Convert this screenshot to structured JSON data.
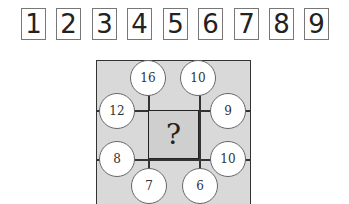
{
  "options": [
    "1",
    "2",
    "3",
    "4",
    "5",
    "6",
    "7",
    "8",
    "9"
  ],
  "puzzle": {
    "question_mark": "?",
    "circles": {
      "top_left": "16",
      "top_right": "10",
      "left_upper": "12",
      "right_upper": "9",
      "left_lower": "8",
      "right_lower": "10",
      "bottom_left": "7",
      "bottom_right": "6"
    }
  },
  "colors": {
    "grid_fill": "#d9d9d9",
    "line": "#333333",
    "circle_fill": "#ffffff"
  }
}
